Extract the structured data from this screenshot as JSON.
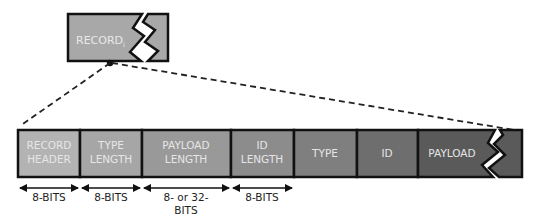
{
  "record_label": "RECORD",
  "record_subscript": "i",
  "fields": [
    {
      "line1": "RECORD",
      "line2": "HEADER",
      "color": "#b3b3b3"
    },
    {
      "line1": "TYPE",
      "line2": "LENGTH",
      "color": "#a6a6a6"
    },
    {
      "line1": "PAYLOAD",
      "line2": "LENGTH",
      "color": "#999999"
    },
    {
      "line1": "ID",
      "line2": "LENGTH",
      "color": "#8c8c8c"
    },
    {
      "line1": "TYPE",
      "line2": "",
      "color": "#7f7f7f"
    },
    {
      "line1": "ID",
      "line2": "",
      "color": "#6e6e6e"
    },
    {
      "line1": "PAYLOAD",
      "line2": "",
      "color": "#5a5a5a"
    }
  ],
  "dimensions": [
    {
      "line1": "8-BITS",
      "line2": ""
    },
    {
      "line1": "8-BITS",
      "line2": ""
    },
    {
      "line1": "8- or 32-",
      "line2": "BITS"
    },
    {
      "line1": "8-BITS",
      "line2": ""
    }
  ]
}
